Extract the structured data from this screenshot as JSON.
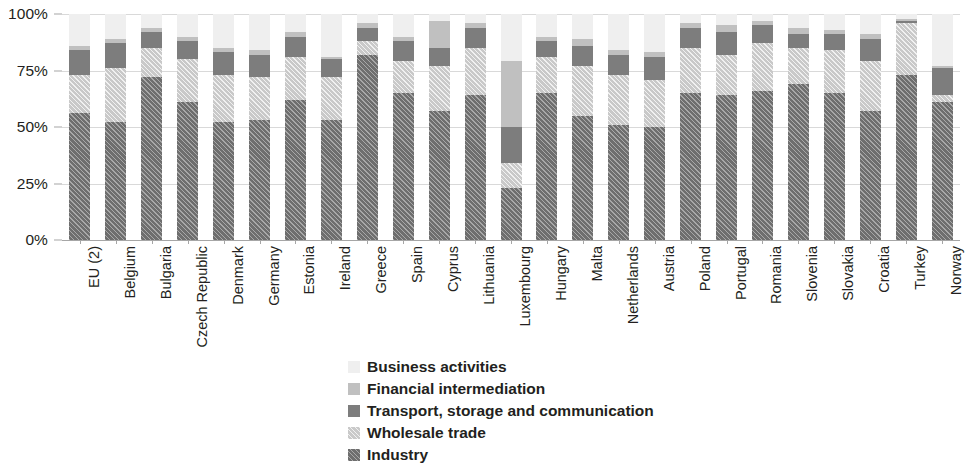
{
  "chart_data": {
    "type": "bar",
    "stacked": true,
    "title": "",
    "xlabel": "",
    "ylabel": "",
    "ylim": [
      0,
      100
    ],
    "y_ticks": [
      0,
      25,
      50,
      75,
      100
    ],
    "y_tick_labels": [
      "0%",
      "25%",
      "50%",
      "75%",
      "100%"
    ],
    "grid": true,
    "legend_position": "bottom-center",
    "units": "percent",
    "categories": [
      "EU (2)",
      "Belgium",
      "Bulgaria",
      "Czech Republic",
      "Denmark",
      "Germany",
      "Estonia",
      "Ireland",
      "Greece",
      "Spain",
      "Cyprus",
      "Lithuania",
      "Luxembourg",
      "Hungary",
      "Malta",
      "Netherlands",
      "Austria",
      "Poland",
      "Portugal",
      "Romania",
      "Slovenia",
      "Slovakia",
      "Croatia",
      "Turkey",
      "Norway"
    ],
    "series": [
      {
        "name": "Industry",
        "color": "#6e6e6e",
        "hatch": true,
        "values": [
          56,
          52,
          72,
          61,
          52,
          53,
          62,
          53,
          82,
          65,
          57,
          64,
          23,
          65,
          55,
          51,
          50,
          65,
          64,
          66,
          69,
          65,
          57,
          73,
          61
        ]
      },
      {
        "name": "Wholesale trade",
        "color": "#c9c9c9",
        "hatch": true,
        "values": [
          17,
          24,
          13,
          19,
          21,
          19,
          19,
          19,
          6,
          14,
          20,
          21,
          11,
          16,
          22,
          22,
          21,
          20,
          18,
          21,
          16,
          19,
          22,
          23,
          3
        ]
      },
      {
        "name": "Transport, storage and communication",
        "color": "#7d7d7d",
        "hatch": false,
        "values": [
          11,
          11,
          7,
          8,
          10,
          10,
          9,
          8,
          6,
          9,
          8,
          9,
          16,
          7,
          9,
          9,
          10,
          9,
          10,
          8,
          6,
          7,
          10,
          1,
          12
        ]
      },
      {
        "name": "Financial intermediation",
        "color": "#c0c0c0",
        "hatch": false,
        "values": [
          2,
          2,
          2,
          2,
          2,
          2,
          2,
          1,
          2,
          2,
          12,
          2,
          29,
          2,
          3,
          2,
          2,
          2,
          3,
          2,
          3,
          2,
          2,
          1,
          1
        ]
      },
      {
        "name": "Business activities",
        "color": "#efefef",
        "hatch": false,
        "values": [
          14,
          11,
          6,
          10,
          15,
          16,
          8,
          19,
          4,
          10,
          3,
          4,
          21,
          10,
          11,
          16,
          17,
          4,
          5,
          3,
          6,
          7,
          9,
          2,
          23
        ]
      }
    ]
  },
  "legend": {
    "items": [
      {
        "label": "Business activities",
        "color": "#efefef",
        "hatch": false
      },
      {
        "label": "Financial intermediation",
        "color": "#c0c0c0",
        "hatch": false
      },
      {
        "label": "Transport, storage and communication",
        "color": "#7d7d7d",
        "hatch": false
      },
      {
        "label": "Wholesale trade",
        "color": "#c9c9c9",
        "hatch": true
      },
      {
        "label": "Industry",
        "color": "#6e6e6e",
        "hatch": true
      }
    ]
  },
  "colors": {
    "gridline": "#d9d9d9",
    "axis": "#a6a6a6",
    "text": "#231f20",
    "background": "#ffffff"
  }
}
